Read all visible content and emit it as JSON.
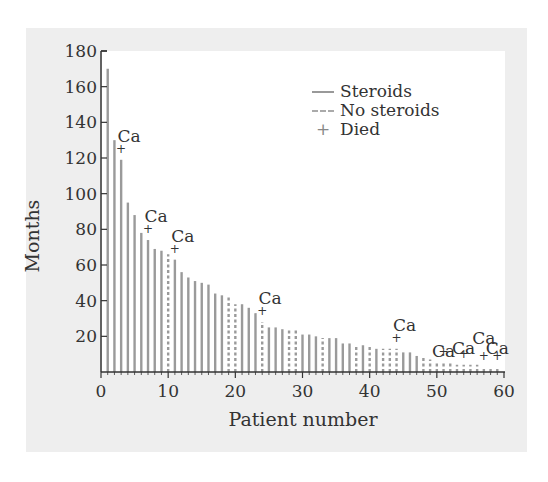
{
  "chart_data": {
    "type": "bar",
    "title": "",
    "xlabel": "Patient number",
    "ylabel": "Months",
    "xlim": [
      0,
      60
    ],
    "ylim": [
      0,
      180
    ],
    "x_ticks": [
      0,
      10,
      20,
      30,
      40,
      50,
      60
    ],
    "y_ticks": [
      20,
      40,
      60,
      80,
      100,
      120,
      140,
      160,
      180
    ],
    "grid": false,
    "legend": {
      "position": "upper right",
      "entries": [
        {
          "label": "Steroids",
          "style": "solid"
        },
        {
          "label": "No steroids",
          "style": "dashed"
        },
        {
          "label": "Died",
          "style": "plus-marker"
        }
      ]
    },
    "annotation_text": "Ca",
    "patients": [
      {
        "x": 1,
        "months": 170,
        "steroids": true,
        "died": false,
        "ca": false
      },
      {
        "x": 2,
        "months": 130,
        "steroids": true,
        "died": false,
        "ca": false
      },
      {
        "x": 3,
        "months": 119,
        "steroids": true,
        "died": true,
        "ca": true
      },
      {
        "x": 4,
        "months": 95,
        "steroids": true,
        "died": false,
        "ca": false
      },
      {
        "x": 5,
        "months": 88,
        "steroids": true,
        "died": false,
        "ca": false
      },
      {
        "x": 6,
        "months": 78,
        "steroids": true,
        "died": false,
        "ca": false
      },
      {
        "x": 7,
        "months": 74,
        "steroids": true,
        "died": true,
        "ca": true
      },
      {
        "x": 8,
        "months": 69,
        "steroids": true,
        "died": false,
        "ca": false
      },
      {
        "x": 9,
        "months": 68,
        "steroids": true,
        "died": false,
        "ca": false
      },
      {
        "x": 10,
        "months": 66,
        "steroids": false,
        "died": false,
        "ca": false
      },
      {
        "x": 11,
        "months": 63,
        "steroids": true,
        "died": true,
        "ca": true
      },
      {
        "x": 12,
        "months": 56,
        "steroids": true,
        "died": false,
        "ca": false
      },
      {
        "x": 13,
        "months": 53,
        "steroids": true,
        "died": false,
        "ca": false
      },
      {
        "x": 14,
        "months": 51,
        "steroids": true,
        "died": false,
        "ca": false
      },
      {
        "x": 15,
        "months": 50,
        "steroids": true,
        "died": false,
        "ca": false
      },
      {
        "x": 16,
        "months": 49,
        "steroids": true,
        "died": false,
        "ca": false
      },
      {
        "x": 17,
        "months": 44,
        "steroids": true,
        "died": false,
        "ca": false
      },
      {
        "x": 18,
        "months": 43,
        "steroids": true,
        "died": false,
        "ca": false
      },
      {
        "x": 19,
        "months": 42,
        "steroids": false,
        "died": false,
        "ca": false
      },
      {
        "x": 20,
        "months": 38,
        "steroids": false,
        "died": false,
        "ca": false
      },
      {
        "x": 21,
        "months": 38,
        "steroids": true,
        "died": false,
        "ca": false
      },
      {
        "x": 22,
        "months": 36,
        "steroids": true,
        "died": false,
        "ca": false
      },
      {
        "x": 23,
        "months": 33,
        "steroids": true,
        "died": false,
        "ca": false
      },
      {
        "x": 24,
        "months": 28,
        "steroids": false,
        "died": true,
        "ca": true
      },
      {
        "x": 25,
        "months": 25,
        "steroids": true,
        "died": false,
        "ca": false
      },
      {
        "x": 26,
        "months": 25,
        "steroids": true,
        "died": false,
        "ca": false
      },
      {
        "x": 27,
        "months": 24,
        "steroids": true,
        "died": false,
        "ca": false
      },
      {
        "x": 28,
        "months": 24,
        "steroids": false,
        "died": false,
        "ca": false
      },
      {
        "x": 29,
        "months": 24,
        "steroids": false,
        "died": false,
        "ca": false
      },
      {
        "x": 30,
        "months": 21,
        "steroids": true,
        "died": false,
        "ca": false
      },
      {
        "x": 31,
        "months": 21,
        "steroids": true,
        "died": false,
        "ca": false
      },
      {
        "x": 32,
        "months": 20,
        "steroids": true,
        "died": false,
        "ca": false
      },
      {
        "x": 33,
        "months": 19,
        "steroids": false,
        "died": false,
        "ca": false
      },
      {
        "x": 34,
        "months": 19,
        "steroids": true,
        "died": false,
        "ca": false
      },
      {
        "x": 35,
        "months": 19,
        "steroids": true,
        "died": false,
        "ca": false
      },
      {
        "x": 36,
        "months": 16,
        "steroids": true,
        "died": false,
        "ca": false
      },
      {
        "x": 37,
        "months": 16,
        "steroids": true,
        "died": false,
        "ca": false
      },
      {
        "x": 38,
        "months": 15,
        "steroids": false,
        "died": false,
        "ca": false
      },
      {
        "x": 39,
        "months": 15,
        "steroids": true,
        "died": false,
        "ca": false
      },
      {
        "x": 40,
        "months": 15,
        "steroids": false,
        "died": false,
        "ca": false
      },
      {
        "x": 41,
        "months": 13,
        "steroids": true,
        "died": false,
        "ca": false
      },
      {
        "x": 42,
        "months": 13,
        "steroids": false,
        "died": false,
        "ca": false
      },
      {
        "x": 43,
        "months": 13,
        "steroids": false,
        "died": false,
        "ca": false
      },
      {
        "x": 44,
        "months": 13,
        "steroids": false,
        "died": true,
        "ca": true
      },
      {
        "x": 45,
        "months": 11,
        "steroids": true,
        "died": false,
        "ca": false
      },
      {
        "x": 46,
        "months": 11,
        "steroids": true,
        "died": false,
        "ca": false
      },
      {
        "x": 47,
        "months": 9,
        "steroids": true,
        "died": false,
        "ca": false
      },
      {
        "x": 48,
        "months": 8,
        "steroids": false,
        "died": false,
        "ca": false
      },
      {
        "x": 49,
        "months": 7,
        "steroids": false,
        "died": false,
        "ca": false
      },
      {
        "x": 50,
        "months": 6,
        "steroids": false,
        "died": false,
        "ca": false
      },
      {
        "x": 51,
        "months": 5,
        "steroids": false,
        "died": true,
        "ca": true
      },
      {
        "x": 52,
        "months": 5,
        "steroids": false,
        "died": false,
        "ca": false
      },
      {
        "x": 53,
        "months": 4,
        "steroids": false,
        "died": false,
        "ca": false
      },
      {
        "x": 54,
        "months": 4,
        "steroids": false,
        "died": true,
        "ca": true
      },
      {
        "x": 55,
        "months": 4,
        "steroids": false,
        "died": false,
        "ca": false
      },
      {
        "x": 56,
        "months": 4,
        "steroids": false,
        "died": false,
        "ca": false
      },
      {
        "x": 57,
        "months": 3,
        "steroids": false,
        "died": true,
        "ca": true
      },
      {
        "x": 58,
        "months": 3,
        "steroids": false,
        "died": false,
        "ca": false
      },
      {
        "x": 59,
        "months": 3,
        "steroids": false,
        "died": true,
        "ca": true
      }
    ]
  },
  "labels": {
    "xlabel": "Patient number",
    "ylabel": "Months",
    "legend_steroids": "Steroids",
    "legend_no_steroids": "No steroids",
    "legend_died": "Died",
    "legend_died_marker": "+"
  },
  "colors": {
    "panel": "#eeeeee",
    "plot": "#ffffff",
    "bar": "#9a9a9a",
    "axis": "#333333",
    "text": "#333333"
  }
}
